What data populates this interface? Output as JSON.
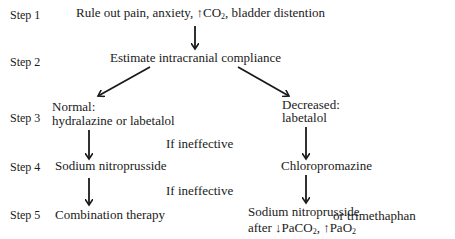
{
  "steps": [
    {
      "label": "Step 1"
    },
    {
      "label": "Step 2"
    },
    {
      "label": "Step 3"
    },
    {
      "label": "Step 4"
    },
    {
      "label": "Step 5"
    }
  ],
  "nodes": {
    "step1": {
      "pre": "Rule out pain, anxiety, ",
      "up_arrow": "↑",
      "co": "CO",
      "sub": "2",
      "post": ", bladder distention"
    },
    "step2": {
      "text": "Estimate intracranial compliance"
    },
    "step3_left": {
      "line1": "Normal:",
      "line2": "hydralazine or labetalol"
    },
    "step3_right": {
      "line1": "Decreased:",
      "line2": "labetalol"
    },
    "step4_left": {
      "text": "Sodium nitroprusside"
    },
    "step4_right": {
      "text": "Chloropromazine"
    },
    "step5_left": {
      "text": "Combination therapy"
    },
    "step5_right": {
      "line1": "Sodium nitroprusside",
      "alt": "or trimethaphan",
      "line2_pre": "after ",
      "down_arrow": "↓",
      "paco": "PaCO",
      "paco_sub": "2",
      "sep": ", ",
      "up_arrow": "↑",
      "pao": "PaO",
      "pao_sub": "2"
    }
  },
  "conditions": [
    {
      "text": "If ineffective"
    },
    {
      "text": "If ineffective"
    }
  ],
  "colors": {
    "ink": "#1a1a1a",
    "background": "#ffffff"
  }
}
